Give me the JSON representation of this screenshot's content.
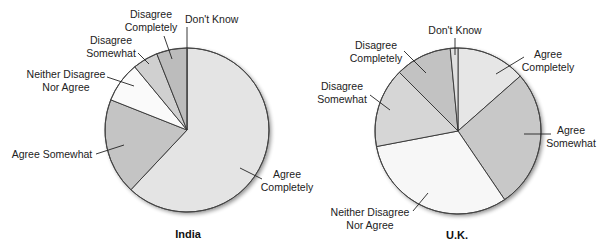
{
  "chart_data": [
    {
      "type": "pie",
      "title": "India",
      "start_angle_deg": 0,
      "direction": "clockwise",
      "center": [
        187,
        130
      ],
      "radius": 82,
      "categories": [
        "Agree Completely",
        "Agree Somewhat",
        "Neither Disagree Nor Agree",
        "Disagree Somewhat",
        "Disagree Completely",
        "Don't Know"
      ],
      "values": [
        62,
        19,
        8,
        5,
        6,
        0
      ],
      "colors": [
        "#e4e4e4",
        "#c4c4c4",
        "#fafafa",
        "#d0d0d0",
        "#bcbcbc",
        "#dcdcdc"
      ],
      "labels": [
        {
          "lines": [
            "Agree",
            "Completely"
          ],
          "x": 287,
          "y": 178,
          "anchor": "middle",
          "leader": [
            [
              262,
              179
            ],
            [
              240,
              168
            ]
          ]
        },
        {
          "lines": [
            "Agree Somewhat"
          ],
          "x": 52,
          "y": 158,
          "anchor": "middle",
          "leader": [
            [
              96,
              154
            ],
            [
              124,
              145
            ]
          ]
        },
        {
          "lines": [
            "Neither Disagree",
            "Nor Agree"
          ],
          "x": 66,
          "y": 78,
          "anchor": "middle",
          "leader": [
            [
              107,
              77
            ],
            [
              134,
              86
            ]
          ]
        },
        {
          "lines": [
            "Disagree",
            "Somewhat"
          ],
          "x": 111,
          "y": 44,
          "anchor": "middle",
          "leader": [
            [
              138,
              53
            ],
            [
              149,
              64
            ]
          ]
        },
        {
          "lines": [
            "Disagree",
            "Completely"
          ],
          "x": 151,
          "y": 18,
          "anchor": "middle",
          "leader": [
            [
              164,
              36
            ],
            [
              172,
              59
            ]
          ]
        },
        {
          "lines": [
            "Don't Know"
          ],
          "x": 185,
          "y": 23,
          "anchor": "start",
          "leader": [
            [
              187,
              27
            ],
            [
              187,
              48
            ]
          ]
        }
      ]
    },
    {
      "type": "pie",
      "title": "U.K.",
      "start_angle_deg": 0,
      "direction": "clockwise",
      "center": [
        458,
        131
      ],
      "radius": 83,
      "categories": [
        "Agree Completely",
        "Agree Somewhat",
        "Neither Disagree Nor Agree",
        "Disagree Somewhat",
        "Disagree Completely",
        "Don't Know"
      ],
      "values": [
        13.5,
        27,
        31.5,
        15.5,
        11,
        1.5
      ],
      "colors": [
        "#e6e6e6",
        "#c8c8c8",
        "#f7f7f7",
        "#d6d6d6",
        "#c2c2c2",
        "#e0e0e0"
      ],
      "labels": [
        {
          "lines": [
            "Agree",
            "Completely"
          ],
          "x": 548,
          "y": 58,
          "anchor": "middle",
          "leader": [
            [
              524,
              57
            ],
            [
              496,
              74
            ]
          ]
        },
        {
          "lines": [
            "Agree",
            "Somewhat"
          ],
          "x": 571,
          "y": 134,
          "anchor": "middle",
          "leader": [
            [
              551,
              134
            ],
            [
              524,
              134
            ]
          ]
        },
        {
          "lines": [
            "Neither Disagree",
            "Nor Agree"
          ],
          "x": 370,
          "y": 216,
          "anchor": "middle",
          "leader": [
            [
              413,
              211
            ],
            [
              428,
              193
            ]
          ]
        },
        {
          "lines": [
            "Disagree",
            "Somewhat"
          ],
          "x": 342,
          "y": 90,
          "anchor": "middle",
          "leader": [
            [
              370,
              95
            ],
            [
              390,
              110
            ]
          ]
        },
        {
          "lines": [
            "Disagree",
            "Completely"
          ],
          "x": 376,
          "y": 49,
          "anchor": "middle",
          "leader": [
            [
              404,
              51
            ],
            [
              426,
              73
            ]
          ]
        },
        {
          "lines": [
            "Don't Know"
          ],
          "x": 455,
          "y": 34,
          "anchor": "middle",
          "leader": [
            [
              455,
              38
            ],
            [
              455,
              55
            ]
          ]
        }
      ]
    }
  ]
}
